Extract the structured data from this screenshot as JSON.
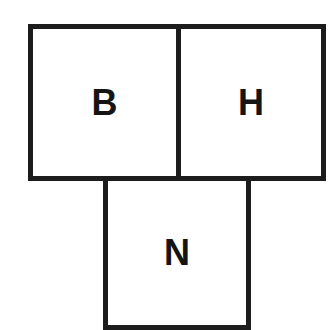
{
  "diagram": {
    "cells": [
      {
        "id": "b",
        "label": "B"
      },
      {
        "id": "h",
        "label": "H"
      },
      {
        "id": "n",
        "label": "N"
      }
    ],
    "colors": {
      "stroke": "#1c1c1c",
      "text": "#141414",
      "background": "#ffffff"
    }
  }
}
